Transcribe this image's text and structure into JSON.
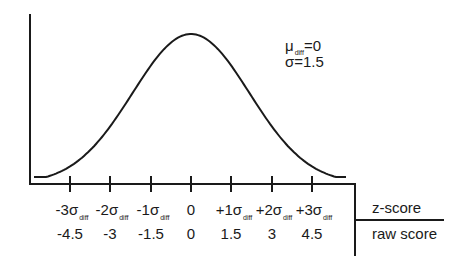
{
  "chart_data": {
    "type": "line",
    "title": "",
    "annotations": {
      "mean": "μ_diff=0",
      "sd": "σ=1.5"
    },
    "params": {
      "mean": 0,
      "sd": 1.5
    },
    "axes": {
      "row1_label": "z-score",
      "row2_label": "raw score"
    },
    "ticks": [
      {
        "z": "-3σ",
        "sub": "diff",
        "raw": "-4.5"
      },
      {
        "z": "-2σ",
        "sub": "diff",
        "raw": "-3"
      },
      {
        "z": "-1σ",
        "sub": "diff",
        "raw": "-1.5"
      },
      {
        "z": "0",
        "sub": "",
        "raw": "0"
      },
      {
        "z": "+1σ",
        "sub": "diff",
        "raw": "1.5"
      },
      {
        "z": "+2σ",
        "sub": "diff",
        "raw": "3"
      },
      {
        "z": "+3σ",
        "sub": "diff",
        "raw": "4.5"
      }
    ],
    "x": [
      -4.5,
      -3,
      -1.5,
      0,
      1.5,
      3,
      4.5
    ],
    "grid": false,
    "legend": null
  },
  "labels": {
    "mu": "μ",
    "mu_sub": "diff",
    "mu_val": "=0",
    "sigma_line": "σ=1.5",
    "zscore": "z-score",
    "rawscore": "raw score",
    "t0": "-3σ",
    "t1": "-2σ",
    "t2": "-1σ",
    "t3": "0",
    "t4": "+1σ",
    "t5": "+2σ",
    "t6": "+3σ",
    "sub": "diff",
    "r0": "-4.5",
    "r1": "-3",
    "r2": "-1.5",
    "r3": "0",
    "r4": "1.5",
    "r5": "3",
    "r6": "4.5"
  }
}
